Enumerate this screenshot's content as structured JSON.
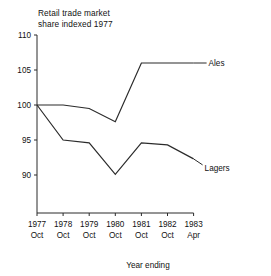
{
  "chart_data": {
    "type": "line",
    "title": "Retail trade market\nshare indexed 1977",
    "xlabel": "Year ending",
    "ylabel": "",
    "grid": false,
    "legend_position": "right-inline-labels",
    "ylim": [
      85,
      110
    ],
    "yticks": [
      "110",
      "105",
      "100",
      "95",
      "90"
    ],
    "ytick_values": [
      110,
      105,
      100,
      95,
      90
    ],
    "categories": [
      "1977 Oct",
      "1978 Oct",
      "1979 Oct",
      "1980 Oct",
      "1981 Oct",
      "1982 Oct",
      "1983 Apr"
    ],
    "xtick_years": [
      "1977",
      "1978",
      "1979",
      "1980",
      "1981",
      "1982",
      "1983"
    ],
    "xtick_months": [
      "Oct",
      "Oct",
      "Oct",
      "Oct",
      "Oct",
      "Oct",
      "Apr"
    ],
    "series": [
      {
        "name": "Ales",
        "color": "#2b2b2b",
        "values": [
          100.0,
          100.0,
          99.5,
          97.6,
          106.0,
          106.0,
          106.0
        ]
      },
      {
        "name": "Lagers",
        "color": "#2b2b2b",
        "values": [
          100.0,
          95.0,
          94.6,
          90.1,
          94.6,
          94.3,
          92.3
        ]
      }
    ]
  }
}
